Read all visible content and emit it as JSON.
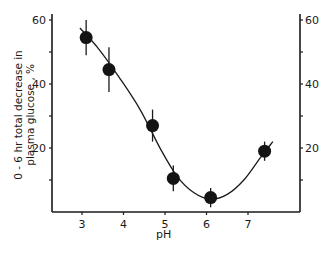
{
  "chart_data": {
    "type": "scatter",
    "title": "",
    "xlabel": "pH",
    "ylabel": "0 - 6 hr total decrease in plasma glucose, %",
    "ylabel_lines": [
      "0 - 6 hr total decrease in",
      "plasma glucose , %"
    ],
    "xlim": [
      2.3,
      8.3
    ],
    "ylim": [
      0,
      60
    ],
    "x_ticks": [
      3,
      4,
      5,
      6,
      7
    ],
    "y_ticks_left": [
      20,
      40,
      60
    ],
    "y_ticks_right": [
      20,
      40,
      60
    ],
    "y_minor_ticks": [
      10,
      30,
      50
    ],
    "grid": false,
    "legend": null,
    "series": [
      {
        "name": "observed",
        "marker": "filled-circle",
        "x": [
          3.1,
          3.65,
          4.7,
          5.2,
          6.1,
          7.4
        ],
        "y": [
          54.5,
          44.5,
          27,
          10.5,
          4.5,
          19
        ],
        "error": [
          5.5,
          7,
          5,
          4,
          3,
          3
        ]
      },
      {
        "name": "fitted-curve",
        "line": "smooth",
        "x": [
          2.95,
          3.4,
          3.9,
          4.4,
          4.9,
          5.3,
          5.7,
          6.1,
          6.5,
          6.9,
          7.3,
          7.6
        ],
        "y": [
          57.5,
          51,
          42,
          32,
          19.5,
          11,
          6,
          4,
          5.5,
          10,
          17,
          22
        ]
      }
    ]
  },
  "labels": {
    "x_axis": "pH",
    "y_line1": "0 - 6 hr total decrease in",
    "y_line2": "plasma glucose , %"
  }
}
